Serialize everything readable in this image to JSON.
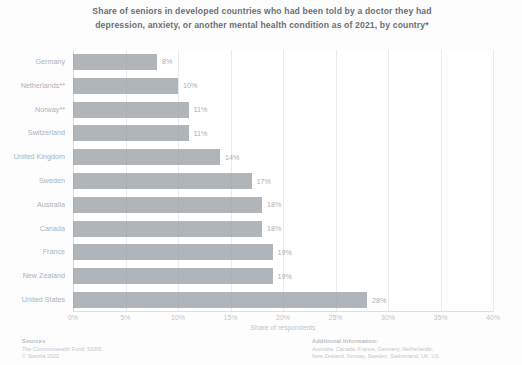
{
  "chart_data": {
    "type": "bar",
    "orientation": "horizontal",
    "title": "Share of seniors in developed countries who had been told by a doctor they had depression, anxiety, or another mental health condition as of 2021, by country*",
    "title_lines": [
      "Share of seniors in developed countries who had been told by a doctor they had",
      "depression, anxiety, or another mental health condition as of 2021, by country*"
    ],
    "categories": [
      "Germany",
      "Netherlands**",
      "Norway**",
      "Switzerland",
      "United Kingdom",
      "Sweden",
      "Australia",
      "Canada",
      "France",
      "New Zealand",
      "United States"
    ],
    "values": [
      8,
      10,
      11,
      11,
      14,
      17,
      18,
      18,
      19,
      19,
      28
    ],
    "value_labels": [
      "8%",
      "10%",
      "11%",
      "11%",
      "14%",
      "17%",
      "18%",
      "18%",
      "19%",
      "19%",
      "28%"
    ],
    "xlabel": "Share of respondents",
    "ylabel": "",
    "xlim": [
      0,
      40
    ],
    "xticks": [
      0,
      5,
      10,
      15,
      20,
      25,
      30,
      35,
      40
    ],
    "xtick_labels": [
      "0%",
      "5%",
      "10%",
      "15%",
      "20%",
      "25%",
      "30%",
      "35%",
      "40%"
    ],
    "grid": true,
    "legend": "none",
    "bar_color": "#9aa0a6"
  },
  "footer": {
    "sources": {
      "heading": "Sources",
      "lines": [
        "The Commonwealth Fund; SSRS",
        "© Statista 2022"
      ]
    },
    "additional": {
      "heading": "Additional Information:",
      "lines": [
        "Australia, Canada, France, Germany, Netherlands,",
        "New Zealand, Norway, Sweden, Switzerland, UK, US"
      ]
    }
  }
}
